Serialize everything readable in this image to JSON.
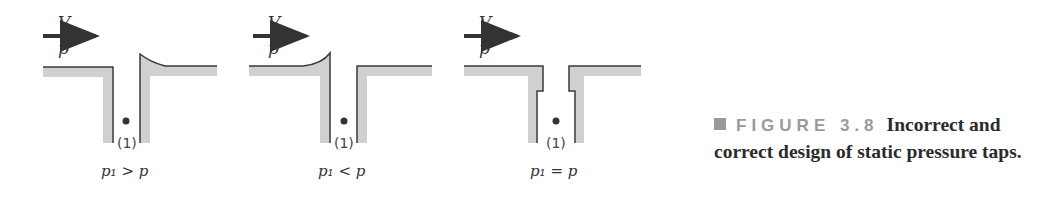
{
  "panels": [
    {
      "velocity_label": "V",
      "pressure_label": "p",
      "point_label": "(1)",
      "relation": "p₁ > p",
      "tap_design": "downstream-lip-raised"
    },
    {
      "velocity_label": "V",
      "pressure_label": "p",
      "point_label": "(1)",
      "relation": "p₁ < p",
      "tap_design": "upstream-lip-raised"
    },
    {
      "velocity_label": "V",
      "pressure_label": "p",
      "point_label": "(1)",
      "relation": "p₁ = p",
      "tap_design": "flush-correct"
    }
  ],
  "caption": {
    "figure_tag": "FIGURE 3.8",
    "text": "Incorrect and correct design of static pressure taps."
  },
  "colors": {
    "wall_fill": "#d0d0d0",
    "wall_line": "#3a3a3a",
    "arrow": "#333333",
    "tag": "#9a9a9a"
  }
}
